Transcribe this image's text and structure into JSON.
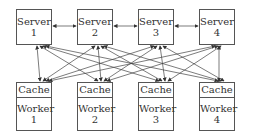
{
  "diagram": {
    "servers": [
      {
        "label": "Server",
        "num": "1"
      },
      {
        "label": "Server",
        "num": "2"
      },
      {
        "label": "Server",
        "num": "3"
      },
      {
        "label": "Server",
        "num": "4"
      }
    ],
    "workers": [
      {
        "cache": "Cache",
        "label": "Worker",
        "num": "1"
      },
      {
        "cache": "Cache",
        "label": "Worker",
        "num": "2"
      },
      {
        "cache": "Cache",
        "label": "Worker",
        "num": "3"
      },
      {
        "cache": "Cache",
        "label": "Worker",
        "num": "4"
      }
    ],
    "connections": "Each server connected bidirectionally to adjacent servers and to every worker",
    "line_color": "#444444"
  }
}
